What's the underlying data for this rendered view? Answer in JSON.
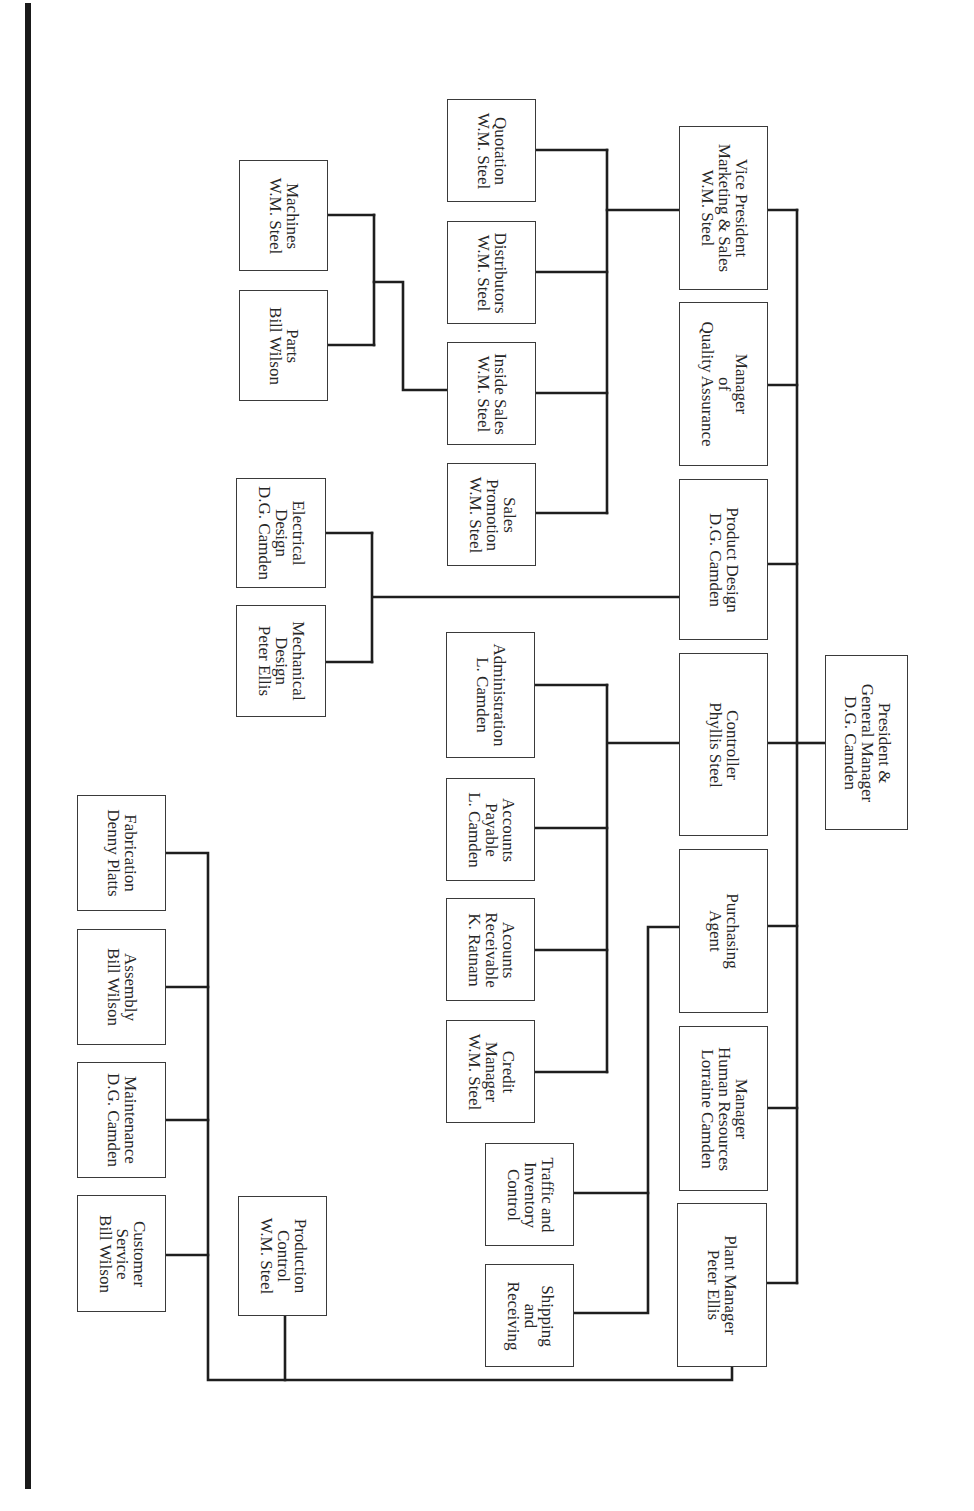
{
  "chart_title": "",
  "orientation": "rotated-90-clockwise",
  "nodes": {
    "president": {
      "lines": [
        "President &",
        "General Manager",
        "D.G. Camden"
      ]
    },
    "vp_marketing": {
      "lines": [
        "Vice President",
        "Marketing & Sales",
        "W.M. Steel"
      ]
    },
    "quality": {
      "lines": [
        "Manager",
        "of",
        "Quality Assurance"
      ]
    },
    "product_design": {
      "lines": [
        "Product Design",
        "D.G. Camden"
      ]
    },
    "controller": {
      "lines": [
        "Controller",
        "Phyllis Steel"
      ]
    },
    "purchasing": {
      "lines": [
        "Purchasing",
        "Agent"
      ]
    },
    "hr": {
      "lines": [
        "Manager",
        "Human Resources",
        "Lorraine Camden"
      ]
    },
    "plant": {
      "lines": [
        "Plant Manager",
        "Peter Ellis"
      ]
    },
    "quotation": {
      "lines": [
        "Quotation",
        "W.M. Steel"
      ]
    },
    "distributors": {
      "lines": [
        "Distributors",
        "W.M. Steel"
      ]
    },
    "inside_sales": {
      "lines": [
        "Inside Sales",
        "W.M. Steel"
      ]
    },
    "sales_promotion": {
      "lines": [
        "Sales",
        "Promotion",
        "W.M. Steel"
      ]
    },
    "machines": {
      "lines": [
        "Machines",
        "W.M. Steel"
      ]
    },
    "parts": {
      "lines": [
        "Parts",
        "Bill Wilson"
      ]
    },
    "electrical": {
      "lines": [
        "Electrical",
        "Design",
        "D.G. Camden"
      ]
    },
    "mechanical": {
      "lines": [
        "Mechanical",
        "Design",
        "Peter Ellis"
      ]
    },
    "administration": {
      "lines": [
        "Administration",
        "L. Camden"
      ]
    },
    "payable": {
      "lines": [
        "Accounts",
        "Payable",
        "L. Camden"
      ]
    },
    "receivable": {
      "lines": [
        "Acounts",
        "Receivable",
        "K. Ratnam"
      ]
    },
    "credit": {
      "lines": [
        "Credit",
        "Manager",
        "W.M. Steel"
      ]
    },
    "traffic": {
      "lines": [
        "Traffic and",
        "Inventory",
        "Control"
      ]
    },
    "shipping": {
      "lines": [
        "Shipping",
        "and",
        "Receiving"
      ]
    },
    "fabrication": {
      "lines": [
        "Fabrication",
        "Denny Platts"
      ]
    },
    "assembly": {
      "lines": [
        "Assembly",
        "Bill Wilson"
      ]
    },
    "maintenance": {
      "lines": [
        "Maintenance",
        "D.G. Camden"
      ]
    },
    "customer_service": {
      "lines": [
        "Customer",
        "Service",
        "Bill Wilson"
      ]
    },
    "production_control": {
      "lines": [
        "Production",
        "Control",
        "W.M. Steel"
      ]
    }
  },
  "hierarchy": {
    "President & General Manager": [
      "Vice President Marketing & Sales",
      "Manager of Quality Assurance",
      "Product Design",
      "Controller",
      "Purchasing Agent",
      "Manager Human Resources",
      "Plant Manager"
    ],
    "Vice President Marketing & Sales": [
      "Quotation",
      "Distributors",
      "Inside Sales",
      "Sales Promotion"
    ],
    "Inside Sales": [
      "Machines",
      "Parts"
    ],
    "Product Design": [
      "Electrical Design",
      "Mechanical Design"
    ],
    "Controller": [
      "Administration",
      "Accounts Payable",
      "Acounts Receivable",
      "Credit Manager"
    ],
    "Purchasing Agent": [
      "Traffic and Inventory Control",
      "Shipping and Receiving"
    ],
    "Plant Manager": [
      "Fabrication",
      "Assembly",
      "Maintenance",
      "Customer Service",
      "Production Control"
    ]
  }
}
